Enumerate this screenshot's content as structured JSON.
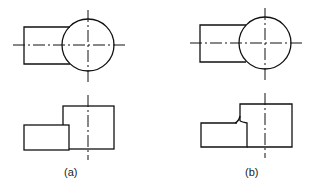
{
  "figure": {
    "panels": [
      {
        "id": "a",
        "label": "(a)",
        "intersection": "sharp corner"
      },
      {
        "id": "b",
        "label": "(b)",
        "intersection": "filleted corner"
      }
    ],
    "colors": {
      "line": "#111111",
      "background": "#ffffff"
    }
  }
}
